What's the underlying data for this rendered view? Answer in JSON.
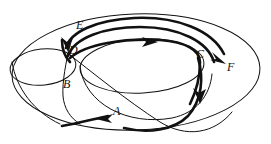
{
  "figure": {
    "kind": "torus-curve-diagram",
    "title": "",
    "background_color": "#ffffff",
    "stroke_color": "#111111",
    "thin_stroke_width": 1.0,
    "thick_stroke_width": 2.6
  },
  "surface": {
    "name": "torus",
    "outer_boundary": {
      "name": "outer-ellipse",
      "cx": 136,
      "cy": 72,
      "rx": 124,
      "ry": 58
    },
    "inner_hole": {
      "name": "inner-ellipse",
      "cx": 142,
      "cy": 66,
      "rx": 62,
      "ry": 27
    },
    "tube_cross_section": {
      "name": "left-tube-ellipse",
      "cx": 43,
      "cy": 67,
      "rx": 33,
      "ry": 18
    },
    "lower_rim": {
      "name": "inner-lower-rim"
    }
  },
  "labels": [
    {
      "id": "A",
      "text": "A",
      "x": 113,
      "y": 112,
      "anchor": "bottom-arrow"
    },
    {
      "id": "B",
      "text": "B",
      "x": 63,
      "y": 85,
      "anchor": "left-descending-curve"
    },
    {
      "id": "C",
      "text": "C",
      "x": 196,
      "y": 55,
      "anchor": "right-turn-point"
    },
    {
      "id": "D",
      "text": "D",
      "x": 69,
      "y": 51,
      "anchor": "upper-left-crossing"
    },
    {
      "id": "E",
      "text": "E",
      "x": 76,
      "y": 26,
      "anchor": "top-left-curve"
    },
    {
      "id": "F",
      "text": "F",
      "x": 227,
      "y": 68,
      "anchor": "right-exit-arrow"
    }
  ],
  "arrows": [
    {
      "id": "arrow-top",
      "direction": "right",
      "x": 152,
      "y": 42,
      "near_label": ""
    },
    {
      "id": "arrow-f",
      "direction": "down-right",
      "x": 221,
      "y": 57,
      "near_label": "F"
    },
    {
      "id": "arrow-c-down",
      "direction": "down",
      "x": 201,
      "y": 98,
      "near_label": "C"
    },
    {
      "id": "arrow-a",
      "direction": "left",
      "x": 105,
      "y": 117,
      "near_label": "A"
    },
    {
      "id": "arrow-d",
      "direction": "down",
      "x": 68,
      "y": 47,
      "near_label": "D"
    }
  ],
  "curves": [
    {
      "id": "thick-loop-outer",
      "style": "thick",
      "description": "bold band running over the top of the torus from D rightwards to F"
    },
    {
      "id": "thick-loop-inner",
      "style": "thick",
      "description": "bold band inside the hole curving to C and down"
    },
    {
      "id": "thick-bottom",
      "style": "thick",
      "description": "bold lower arc ending at arrow A"
    },
    {
      "id": "thin-meridian-b",
      "style": "thin",
      "description": "thin curve through B down to the lower rim"
    },
    {
      "id": "thin-diagonal",
      "style": "thin",
      "description": "thin curve from D sweeping down to the bottom right"
    }
  ]
}
